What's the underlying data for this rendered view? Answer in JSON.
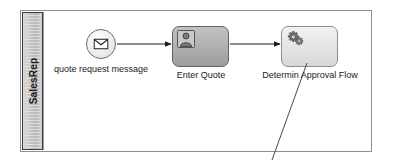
{
  "diagram": {
    "type": "bpmn-process-diagram",
    "pool": {
      "lane": {
        "label": "SalesRep"
      }
    },
    "nodes": [
      {
        "id": "start",
        "kind": "message-start-event",
        "icon": "envelope-icon",
        "label": "quote request message"
      },
      {
        "id": "task1",
        "kind": "user-task",
        "icon": "user-icon",
        "label": "Enter Quote"
      },
      {
        "id": "task2",
        "kind": "business-rule-task",
        "icon": "gears-icon",
        "label": "Determin Approval Flow"
      }
    ],
    "connectors": [
      {
        "id": "flow1",
        "from": "start",
        "to": "task1",
        "kind": "sequence-flow"
      },
      {
        "id": "flow2",
        "from": "task1",
        "to": "task2",
        "kind": "sequence-flow"
      },
      {
        "id": "flow3",
        "from": "task2",
        "to": "",
        "kind": "sequence-flow-outgoing"
      }
    ]
  },
  "colors": {
    "frame_border": "#8f8f8f",
    "lane_header_border": "#3c3c3c",
    "task_user_fill": "#b2b2b2",
    "task_rule_fill": "#e6e6e6",
    "connector": "#1b1b1b",
    "text": "#1b1b1b"
  }
}
